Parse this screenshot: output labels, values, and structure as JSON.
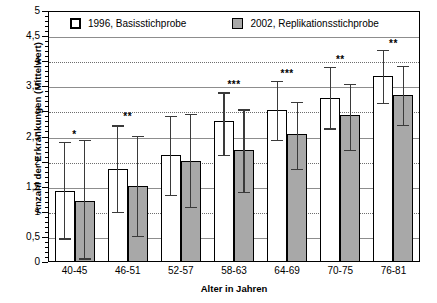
{
  "chart_data": {
    "type": "bar",
    "title": "",
    "xlabel": "Alter in Jahren",
    "ylabel": "Anzahl der Erkrankungen (Mittelwert)",
    "ylim": [
      0,
      5
    ],
    "ytick_step": 0.5,
    "ytick_labels": [
      "5",
      "4,5",
      "4",
      "3,5",
      "3",
      "2,5",
      "2",
      "1,5",
      "1",
      "0,5",
      "0"
    ],
    "ytick_values": [
      5,
      4.5,
      4,
      3.5,
      3,
      2.5,
      2,
      1.5,
      1,
      0.5,
      0
    ],
    "grid": true,
    "grid_axis": "y",
    "legend_position": "top-inside",
    "categories": [
      "40-45",
      "46-51",
      "52-57",
      "58-63",
      "64-69",
      "70-75",
      "76-81"
    ],
    "series": [
      {
        "name": "1996, Basisstichprobe",
        "color": "#ffffff",
        "edge_color": "#000000",
        "values": [
          1.42,
          1.85,
          2.13,
          2.81,
          3.02,
          3.27,
          3.7
        ],
        "error_low": [
          0.47,
          1.0,
          1.33,
          2.14,
          2.43,
          2.66,
          3.17
        ],
        "error_high": [
          2.4,
          2.72,
          2.91,
          3.38,
          3.61,
          3.88,
          4.22
        ]
      },
      {
        "name": "2002, Replikationsstichprobe",
        "color": "#a8a8a8",
        "edge_color": "#000000",
        "values": [
          1.22,
          1.52,
          2.02,
          2.23,
          2.56,
          2.92,
          3.32
        ],
        "error_low": [
          0.07,
          0.52,
          1.09,
          1.39,
          1.86,
          2.23,
          2.73
        ],
        "error_high": [
          2.44,
          2.51,
          2.95,
          3.04,
          3.19,
          3.55,
          3.91
        ]
      }
    ],
    "significance_markers": [
      "*",
      "**",
      "",
      "***",
      "***",
      "**",
      "**"
    ],
    "significance_at": [
      2.52,
      2.88,
      null,
      3.52,
      3.74,
      4.02,
      4.34
    ]
  }
}
